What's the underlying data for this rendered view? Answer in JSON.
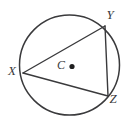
{
  "figure": {
    "type": "circle-with-inscribed-triangle",
    "background_color": "#ffffff",
    "stroke_color": "#3a3a3c",
    "label_color": "#3a3a3c",
    "canvas": {
      "width": 133,
      "height": 127
    },
    "circle": {
      "name": "circle-C",
      "center_x": 69.5,
      "center_y": 65,
      "radius": 50,
      "stroke_width": 1.5
    },
    "center_point": {
      "label": "C",
      "label_x": 61,
      "label_y": 66,
      "dot_x": 72,
      "dot_y": 66.5,
      "dot_radius": 2.6
    },
    "triangle": {
      "name": "triangle-XYZ",
      "stroke_width": 1.4,
      "vertices": [
        {
          "label": "X",
          "x": 23,
          "y": 73,
          "label_x": 12,
          "label_y": 72.5
        },
        {
          "label": "Y",
          "x": 105,
          "y": 26,
          "label_x": 110,
          "label_y": 16.5
        },
        {
          "label": "Z",
          "x": 108,
          "y": 96,
          "label_x": 113,
          "label_y": 100.5
        }
      ],
      "sides": [
        {
          "name": "side-XY",
          "from": "X",
          "to": "Y"
        },
        {
          "name": "side-YZ",
          "from": "Y",
          "to": "Z"
        },
        {
          "name": "side-ZX",
          "from": "Z",
          "to": "X"
        }
      ]
    }
  }
}
